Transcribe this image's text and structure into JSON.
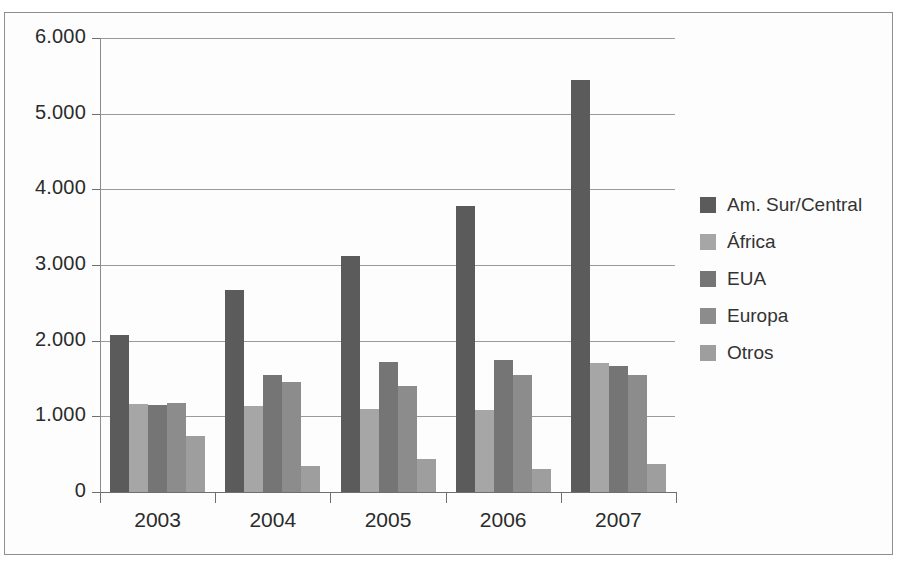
{
  "chart_data": {
    "type": "bar",
    "title": "",
    "subtitle": "",
    "xlabel": "",
    "ylabel": "",
    "categories": [
      "2003",
      "2004",
      "2005",
      "2006",
      "2007"
    ],
    "ylim": [
      0,
      6000
    ],
    "yticks": [
      0,
      1000,
      2000,
      3000,
      4000,
      5000,
      6000
    ],
    "ytick_labels": [
      "0",
      "1.000",
      "2.000",
      "3.000",
      "4.000",
      "5.000",
      "6.000"
    ],
    "grid": true,
    "legend_position": "right",
    "series": [
      {
        "name": "Am. Sur/Central",
        "color": "#5b5b5b",
        "values": [
          2080,
          2670,
          3120,
          3780,
          5450
        ]
      },
      {
        "name": "África",
        "color": "#a6a6a6",
        "values": [
          1160,
          1140,
          1100,
          1090,
          1710
        ]
      },
      {
        "name": "EUA",
        "color": "#757575",
        "values": [
          1150,
          1540,
          1720,
          1740,
          1660
        ]
      },
      {
        "name": "Europa",
        "color": "#8c8c8c",
        "values": [
          1180,
          1460,
          1400,
          1540,
          1540
        ]
      },
      {
        "name": "Otros",
        "color": "#9e9e9e",
        "values": [
          740,
          350,
          430,
          310,
          370
        ]
      }
    ]
  }
}
